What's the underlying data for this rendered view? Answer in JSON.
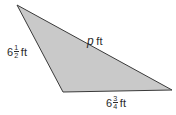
{
  "figure": {
    "type": "triangle",
    "background_color": "#ffffff",
    "fill_color": "#c9c9c9",
    "stroke_color": "#3a3a3a",
    "stroke_width": 1,
    "vertices": {
      "top_left": {
        "x": 17,
        "y": 5
      },
      "bottom_left": {
        "x": 63,
        "y": 92
      },
      "right": {
        "x": 172,
        "y": 90
      }
    },
    "points_attr": "17,5 63,92 172,90"
  },
  "labels": {
    "left_side": {
      "whole": "6",
      "numerator": "1",
      "denominator": "2",
      "unit": "ft",
      "full_text": "6 1/2 ft"
    },
    "hypotenuse": {
      "variable": "p",
      "unit": "ft",
      "full_text": "p ft"
    },
    "bottom_side": {
      "whole": "6",
      "numerator": "3",
      "denominator": "4",
      "unit": "ft",
      "full_text": "6 3/4 ft"
    }
  }
}
